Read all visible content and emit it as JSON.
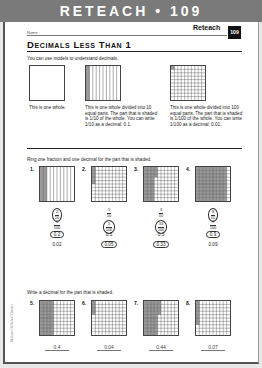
{
  "header": {
    "band_title": "RETEACH • 109",
    "name_label": "Name",
    "reteach_label": "Reteach",
    "lesson_number": "109"
  },
  "title": "Decimals Less Than 1",
  "intro": "You can use models to understand decimals.",
  "models": [
    {
      "caption": "This is one whole.",
      "type": "whole"
    },
    {
      "caption": "This is one whole divided into 10 equal parts. The part that is shaded is 1/10 of the whole. You can write 1/10 as a decimal: 0.1.",
      "type": "tenths"
    },
    {
      "caption": "This is one whole divided into 100 equal parts. The part that is shaded is 1/100 of the whole. You can write 1/100 as a decimal: 0.01.",
      "type": "hundredths"
    }
  ],
  "section1": {
    "instruction": "Ring one fraction and one decimal for the part that is shaded.",
    "items": [
      {
        "number": "1.",
        "grid": "tenths",
        "shaded": 2,
        "fractions": [
          {
            "n": "2",
            "d": "10",
            "ringed": true
          },
          {
            "n": "1",
            "d": "100",
            "ringed": false
          }
        ],
        "decimals": [
          {
            "v": "0.2",
            "ringed": true
          },
          {
            "v": "0.02",
            "ringed": false
          }
        ]
      },
      {
        "number": "2.",
        "grid": "hundredths",
        "shaded": 5,
        "fractions": [
          {
            "n": "5",
            "d": "10",
            "ringed": false
          },
          {
            "n": "5",
            "d": "100",
            "ringed": true
          }
        ],
        "decimals": [
          {
            "v": "0.5",
            "ringed": false
          },
          {
            "v": "0.05",
            "ringed": true
          }
        ]
      },
      {
        "number": "3.",
        "grid": "hundredths",
        "shaded": 33,
        "fractions": [
          {
            "n": "3",
            "d": "10",
            "ringed": false
          },
          {
            "n": "33",
            "d": "100",
            "ringed": true
          }
        ],
        "decimals": [
          {
            "v": "0.3",
            "ringed": false
          },
          {
            "v": "0.33",
            "ringed": true
          }
        ]
      },
      {
        "number": "4.",
        "grid": "hundredths",
        "shaded": 90,
        "fractions": [
          {
            "n": "8",
            "d": "10",
            "ringed": true
          },
          {
            "n": "9",
            "d": "100",
            "ringed": false
          }
        ],
        "decimals": [
          {
            "v": "0.9",
            "ringed": true
          },
          {
            "v": "0.09",
            "ringed": false
          }
        ]
      }
    ]
  },
  "section2": {
    "instruction": "Write a decimal for the part that is shaded.",
    "items": [
      {
        "number": "5.",
        "shaded": 40,
        "answer": "0.4"
      },
      {
        "number": "6.",
        "shaded": 4,
        "answer": "0.04"
      },
      {
        "number": "7.",
        "shaded": 44,
        "answer": "0.44"
      },
      {
        "number": "8.",
        "shaded": 7,
        "answer": "0.07"
      }
    ]
  },
  "side_text": "McGraw-Hill School Division"
}
